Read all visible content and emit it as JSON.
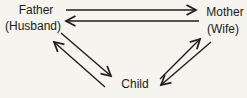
{
  "diagram": {
    "nodes": {
      "father": {
        "label": "Father",
        "sublabel": "(Husband)"
      },
      "mother": {
        "label": "Mother",
        "sublabel": "(Wife)"
      },
      "child": {
        "label": "Child"
      }
    },
    "edges": [
      {
        "from": "Father",
        "to": "Mother"
      },
      {
        "from": "Mother",
        "to": "Father"
      },
      {
        "from": "Father",
        "to": "Child"
      },
      {
        "from": "Child",
        "to": "Father"
      },
      {
        "from": "Mother",
        "to": "Child"
      },
      {
        "from": "Child",
        "to": "Mother"
      }
    ],
    "colors": {
      "line": "#1e1e1e",
      "text": "#1a1a1a",
      "background": "#f5f4ef"
    }
  }
}
